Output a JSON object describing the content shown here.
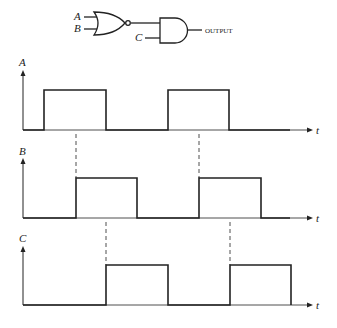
{
  "gate": {
    "input_a": "A",
    "input_b": "B",
    "input_c": "C",
    "output_label": "OUTPUT",
    "first_gate": "NOR",
    "second_gate": "AND"
  },
  "waveforms": [
    {
      "name": "A",
      "axis_label": "t",
      "transitions": [
        44,
        106,
        168,
        229
      ]
    },
    {
      "name": "B",
      "axis_label": "t",
      "transitions": [
        75,
        137,
        199,
        261
      ]
    },
    {
      "name": "C",
      "axis_label": "t",
      "transitions": [
        106,
        168,
        230,
        291
      ]
    }
  ],
  "colors": {
    "stroke": "#222222"
  }
}
